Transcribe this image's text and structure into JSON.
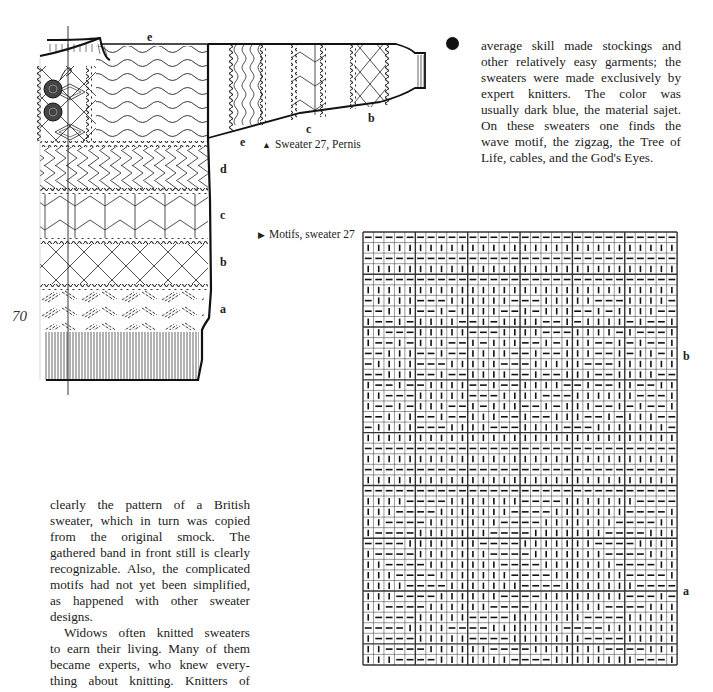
{
  "page_number": "70",
  "bullet": "filled-circle",
  "right_column_text": [
    "average skill made stockings and",
    "other relatively easy garments; the",
    "sweaters were made exclusively by",
    "expert knitters. The color was",
    "usually dark blue, the material sajet.",
    "On these sweaters one finds the",
    "wave motif, the zigzag, the Tree of",
    "Life, cables, and the God's Eyes."
  ],
  "left_column_text": {
    "paragraph1": [
      "clearly the pattern of a British",
      "sweater, which in turn was copied",
      "from the original smock. The",
      "gathered band in front still is clearly",
      "recognizable. Also, the complicated",
      "motifs had not yet been simplified,",
      "as happened with other sweater",
      "designs."
    ],
    "paragraph2": [
      "Widows often knitted sweaters",
      "to earn their living. Many of them",
      "became experts, who knew every-",
      "thing about knitting. Knitters of"
    ]
  },
  "figure_sweater": {
    "caption_marker": "▲",
    "caption": "Sweater 27, Pernis",
    "body_labels": [
      "d",
      "c",
      "b",
      "a"
    ],
    "top_label": "e",
    "sleeve_labels": [
      "e",
      "c",
      "b"
    ]
  },
  "figure_chart": {
    "caption_marker": "▶",
    "caption": "Motifs, sweater 27",
    "side_labels": [
      "b",
      "a"
    ],
    "columns": 30,
    "rows": [
      "------------------------------",
      "||||||||||||||||||||||||||||||",
      "------------------------------",
      "||||||||||||||||||||||||||||||",
      "------------------------------",
      "||||||||||||||||||||||||||||||",
      "-||||---||||||---|||||---||||-",
      "--|||--|-||||--|-|||--|-||||--",
      "|--|-||||--|-||||--|-||||-|--|",
      "||---|||||---||||---||||-|---|",
      "|--|-|||--|-|||--|-|||--|-|--|",
      "--|||--|--||||--|--|||--|-||-|",
      "-||||---|||||---|||||---||||||",
      "--|||--|--||||--|--|||--||||--",
      "|--|--||||--|--||||--|--||--||",
      "||---|||||---||||---||||||---|",
      "|--|-|||--|-|||--|-|||--|-|--|",
      "--|||--|--|||--|--|||--|-|||--",
      "-||||---||||---||||---|||||||-",
      "||||||||||||||||||||||||||||||",
      "------------------------------",
      "||||||||||||||||||||||||||||||",
      "------------------------------",
      "||||||||||||||||||||||||||||||",
      "------------------------------",
      "||||----|||||||----|||||||----",
      "|||----|||||||----|||||||----|",
      "||----|||||||----|||||||----||",
      "|----|||||||----|||||||----|||",
      "----|||||||----|||||||----||||",
      "|----|||||||----|||||||----|||",
      "||----|||||||----|||||||----||",
      "|||----|||||||----|||||||----|",
      "||||----|||||||----|||||||----",
      "|||----||||||----||||||||---|-",
      "||----||||||----|||||||----|||",
      "|----|||||----|||||||----|||||",
      "----||||----|||||||----|||||||",
      "|----|||||----|||||||----|||||",
      "||----||||||----|||||||----|||",
      "|||----|||||||----||||||||---|"
    ],
    "grid_color": "#333333"
  }
}
